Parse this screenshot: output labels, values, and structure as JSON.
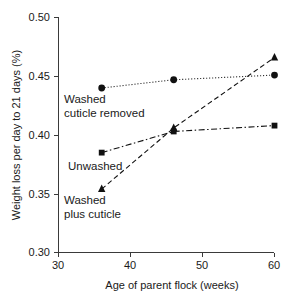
{
  "chart_data": {
    "type": "line",
    "title": "",
    "xlabel": "Age of parent flock (weeks)",
    "ylabel": "Weight loss per day to 21 days (%)",
    "xlim": [
      30,
      60
    ],
    "ylim": [
      0.3,
      0.5
    ],
    "grid": false,
    "legend_position": "inline-annotations",
    "x": [
      36,
      46,
      60
    ],
    "xticks": [
      "30",
      "40",
      "50",
      "60"
    ],
    "xtick_values": [
      30,
      40,
      50,
      60
    ],
    "yticks": [
      "0.30",
      "0.35",
      "0.40",
      "0.45",
      "0.50"
    ],
    "ytick_values": [
      0.3,
      0.35,
      0.4,
      0.45,
      0.5
    ],
    "series": [
      {
        "name": "Washed cuticle removed",
        "label_line1": "Washed",
        "label_line2": "cuticle removed",
        "marker": "circle",
        "linestyle": "dotted",
        "color": "#111111",
        "values": [
          0.44,
          0.447,
          0.451
        ]
      },
      {
        "name": "Unwashed",
        "label_line1": "Unwashed",
        "label_line2": "",
        "marker": "square",
        "linestyle": "dashdot",
        "color": "#111111",
        "values": [
          0.385,
          0.403,
          0.408
        ]
      },
      {
        "name": "Washed plus cuticle",
        "label_line1": "Washed",
        "label_line2": "plus cuticle",
        "marker": "triangle",
        "linestyle": "dashed",
        "color": "#111111",
        "values": [
          0.354,
          0.406,
          0.466
        ]
      }
    ]
  },
  "axes": {
    "x_title": "Age of parent flock (weeks)",
    "y_title": "Weight loss per day to 21 days (%)",
    "xticks": [
      "30",
      "40",
      "50",
      "60"
    ],
    "yticks": [
      "0.30",
      "0.35",
      "0.40",
      "0.45",
      "0.50"
    ]
  },
  "annotations": {
    "washed_cuticle_removed_line1": "Washed",
    "washed_cuticle_removed_line2": "cuticle removed",
    "unwashed_line1": "Unwashed",
    "washed_plus_cuticle_line1": "Washed",
    "washed_plus_cuticle_line2": "plus cuticle"
  }
}
